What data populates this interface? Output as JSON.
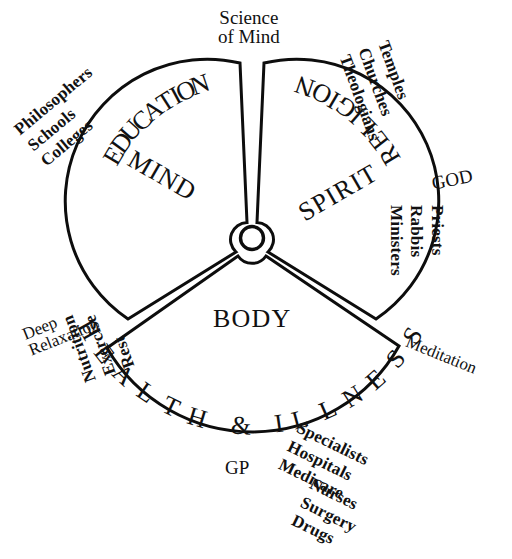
{
  "diagram": {
    "background_color": "#ffffff",
    "line_color": "#0d0d0d",
    "hub": {
      "label": ""
    },
    "sectors": [
      {
        "id": "mind",
        "core_label": "MIND",
        "arc_label": "EDUCATION",
        "outer_items": [
          "Philosophers",
          "Schools",
          "Colleges"
        ]
      },
      {
        "id": "spirit",
        "core_label": "SPIRIT",
        "arc_label": "RELIGION",
        "outer_items": [
          "Temples",
          "Churches",
          "Theologians"
        ],
        "outer_items_2": [
          "Priests",
          "Rabbis",
          "Ministers"
        ],
        "note": "GOD"
      },
      {
        "id": "body",
        "core_label": "BODY",
        "arc_label": "HEALTH & ILLNESS",
        "outer_items": [
          "Nutrition",
          "Exercise",
          "Rest"
        ],
        "outer_items_2": [
          "Specialists",
          "Hospitals",
          "Medicare"
        ],
        "outer_items_3": [
          "Nurses",
          "Surgery",
          "Drugs"
        ],
        "note": "GP"
      }
    ],
    "gap_labels": {
      "top": [
        "Science",
        "of Mind"
      ],
      "left": [
        "Deep",
        "Relaxation"
      ],
      "right": [
        "Meditation"
      ]
    }
  }
}
